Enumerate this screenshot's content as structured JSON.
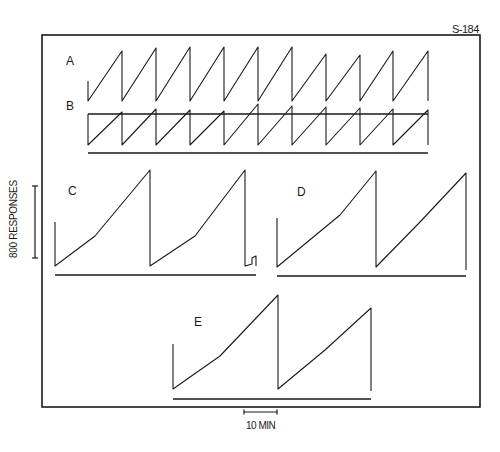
{
  "figure": {
    "id_label": "S-184",
    "colors": {
      "ink": "#1a1a1a",
      "background": "#ffffff"
    }
  },
  "scales": {
    "y_label": "800 RESPONSES",
    "x_label": "10 MIN"
  },
  "chart_data": {
    "type": "line",
    "title": "",
    "subtitle": "Cumulative response records (S-184)",
    "xlabel": "Time (scale bar: 10 MIN)",
    "ylabel": "Cumulative responses (scale bar: 800 RESPONSES)",
    "grid": false,
    "legend": null,
    "annotations": [
      "S-184",
      "800 RESPONSES",
      "10 MIN"
    ],
    "panels": [
      {
        "label": "A",
        "description": "Cumulative record with pen resets; ~11 short excursions",
        "baseline_y": 114,
        "x_start": 88,
        "x_end": 428,
        "points": [
          [
            88,
            81
          ],
          [
            88,
            101
          ],
          [
            122,
            51
          ],
          [
            122,
            81
          ],
          [
            122,
            101
          ],
          [
            156,
            48
          ],
          [
            156,
            81
          ],
          [
            156,
            101
          ],
          [
            190,
            47
          ],
          [
            190,
            81
          ],
          [
            190,
            101
          ],
          [
            224,
            47
          ],
          [
            224,
            81
          ],
          [
            224,
            101
          ],
          [
            258,
            47
          ],
          [
            258,
            81
          ],
          [
            258,
            101
          ],
          [
            292,
            47
          ],
          [
            292,
            81
          ],
          [
            292,
            101
          ],
          [
            326,
            54
          ],
          [
            326,
            81
          ],
          [
            326,
            101
          ],
          [
            360,
            55
          ],
          [
            360,
            81
          ],
          [
            360,
            101
          ],
          [
            393,
            51
          ],
          [
            393,
            81
          ],
          [
            393,
            101
          ],
          [
            428,
            51
          ],
          [
            428,
            81
          ]
        ],
        "segments": [
          [
            [
              88,
              81
            ],
            [
              88,
              101
            ],
            [
              122,
              51
            ],
            [
              122,
              101
            ],
            [
              156,
              48
            ],
            [
              156,
              101
            ],
            [
              190,
              47
            ],
            [
              190,
              101
            ],
            [
              224,
              47
            ],
            [
              224,
              101
            ],
            [
              258,
              47
            ],
            [
              258,
              101
            ],
            [
              292,
              47
            ],
            [
              292,
              101
            ],
            [
              326,
              54
            ],
            [
              326,
              101
            ],
            [
              360,
              55
            ],
            [
              360,
              101
            ],
            [
              393,
              51
            ],
            [
              393,
              101
            ],
            [
              428,
              51
            ],
            [
              428,
              101
            ]
          ]
        ]
      },
      {
        "label": "B",
        "description": "Cumulative record with pen resets; ~10 short excursions",
        "baseline_y": 153,
        "x_start": 88,
        "x_end": 428,
        "segments": [
          [
            [
              88,
              114
            ],
            [
              88,
              145
            ],
            [
              122,
              112
            ],
            [
              122,
              145
            ],
            [
              156,
              109
            ],
            [
              156,
              145
            ],
            [
              190,
              110
            ],
            [
              190,
              145
            ],
            [
              224,
              111
            ],
            [
              224,
              145
            ],
            [
              258,
              104
            ],
            [
              258,
              145
            ],
            [
              292,
              106
            ],
            [
              292,
              145
            ],
            [
              326,
              107
            ],
            [
              326,
              145
            ],
            [
              360,
              108
            ],
            [
              360,
              145
            ],
            [
              393,
              109
            ],
            [
              393,
              145
            ],
            [
              428,
              110
            ],
            [
              428,
              145
            ]
          ]
        ]
      },
      {
        "label": "C",
        "description": "Cumulative record, long excursions (~2 full resets in ~33 min)",
        "baseline_y": 275,
        "x_start": 55,
        "x_end": 256,
        "segments": [
          [
            [
              55,
              222
            ],
            [
              55,
              266
            ],
            [
              95,
              236
            ],
            [
              150,
              170
            ],
            [
              150,
              266
            ],
            [
              195,
              236
            ],
            [
              245,
              170
            ],
            [
              245,
              266
            ],
            [
              252,
              264
            ],
            [
              252,
              258
            ],
            [
              256,
              256
            ],
            [
              256,
              266
            ]
          ]
        ]
      },
      {
        "label": "D",
        "description": "Cumulative record, long excursions",
        "baseline_y": 276,
        "x_start": 277,
        "x_end": 466,
        "segments": [
          [
            [
              277,
              218
            ],
            [
              277,
              267
            ],
            [
              340,
              215
            ],
            [
              376,
              171
            ],
            [
              376,
              267
            ],
            [
              420,
              222
            ],
            [
              466,
              173
            ],
            [
              466,
              270
            ]
          ]
        ]
      },
      {
        "label": "E",
        "description": "Cumulative record, long excursions",
        "baseline_y": 399,
        "x_start": 173,
        "x_end": 371,
        "segments": [
          [
            [
              173,
              344
            ],
            [
              173,
              389
            ],
            [
              220,
              356
            ],
            [
              278,
              295
            ],
            [
              278,
              389
            ],
            [
              325,
              350
            ],
            [
              371,
              308
            ],
            [
              371,
              391
            ]
          ]
        ]
      }
    ],
    "scale_bars": {
      "y": {
        "label": "800 RESPONSES",
        "x": 35,
        "y_top": 186,
        "y_bottom": 258,
        "responses": 800
      },
      "x": {
        "label": "10 MIN",
        "y": 412,
        "x_left": 244,
        "x_right": 277,
        "minutes": 10
      }
    },
    "frame": {
      "left": 42,
      "top": 35,
      "right": 480,
      "bottom": 407
    }
  },
  "panel_labels": {
    "A": "A",
    "B": "B",
    "C": "C",
    "D": "D",
    "E": "E"
  }
}
